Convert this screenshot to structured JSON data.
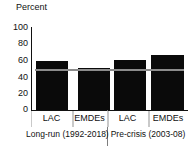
{
  "chart_data": {
    "type": "bar",
    "title": "",
    "ylabel": "Percent",
    "xlabel": "",
    "ylim": [
      0,
      100
    ],
    "yticks": [
      100,
      80,
      60,
      40,
      20,
      0
    ],
    "ytick_labels": [
      "100",
      "80",
      "60",
      "40",
      "20",
      "0"
    ],
    "grid": false,
    "legend": "none",
    "bar_color": "#0a0a0a",
    "line_color": "#8c8c8c",
    "categories": [
      "LAC",
      "EMDEs",
      "LAC",
      "EMDEs"
    ],
    "values": [
      59,
      51,
      60,
      66
    ],
    "groups": [
      {
        "label": "Long-run (1992-2018)",
        "categories": [
          "LAC",
          "EMDEs"
        ],
        "values": [
          59,
          51
        ]
      },
      {
        "label": "Pre-crisis (2003-08)",
        "categories": [
          "LAC",
          "EMDEs"
        ],
        "values": [
          60,
          66
        ]
      }
    ],
    "series": [
      {
        "name": "Percent",
        "values": [
          59,
          51,
          60,
          66
        ]
      }
    ],
    "reference_line": {
      "label": "",
      "value": 50
    },
    "annotations": []
  },
  "axis": {
    "y_title": "Percent"
  },
  "bars": [
    {
      "label": "LAC",
      "value": 59,
      "left": 5,
      "width": 32
    },
    {
      "label": "EMDEs",
      "value": 51,
      "left": 47,
      "width": 32
    },
    {
      "label": "LAC",
      "value": 60,
      "left": 83,
      "width": 32
    },
    {
      "label": "EMDEs",
      "value": 66,
      "left": 120,
      "width": 33
    }
  ],
  "groups": [
    {
      "label": "Long-run (1992-2018)"
    },
    {
      "label": "Pre-crisis (2003-08)"
    }
  ]
}
